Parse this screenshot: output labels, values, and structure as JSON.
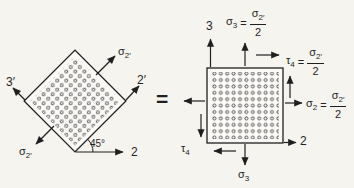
{
  "colors": {
    "ink": "#1f1f1f",
    "paper": "#f5f4ef",
    "element_fill": "#fbfaf7"
  },
  "equals_sign": "=",
  "left_element": {
    "description": "square element rotated 45 degrees under uniaxial tension",
    "sigma_top": {
      "base": "σ",
      "sub": "2′"
    },
    "sigma_bottom": {
      "base": "σ",
      "sub": "2′"
    },
    "axis_2prime": "2′",
    "axis_3prime": "3′",
    "axis_2": "2",
    "angle": "45°"
  },
  "right_element": {
    "description": "axis-aligned element with equivalent biaxial plus shear stresses",
    "axis_3": "3",
    "axis_2": "2",
    "sigma3_eq": {
      "base": "σ",
      "sub": "3",
      "eq": "=",
      "num_base": "σ",
      "num_sub": "2′",
      "den": "2"
    },
    "tau4_eq": {
      "base": "τ",
      "sub": "4",
      "eq": "=",
      "num_base": "σ",
      "num_sub": "2′",
      "den": "2"
    },
    "sigma2_eq": {
      "base": "σ",
      "sub": "2",
      "eq": "=",
      "num_base": "σ",
      "num_sub": "2′",
      "den": "2"
    },
    "tau_bottom": {
      "base": "τ",
      "sub": "4"
    },
    "sigma_bottom": {
      "base": "σ",
      "sub": "3"
    }
  }
}
